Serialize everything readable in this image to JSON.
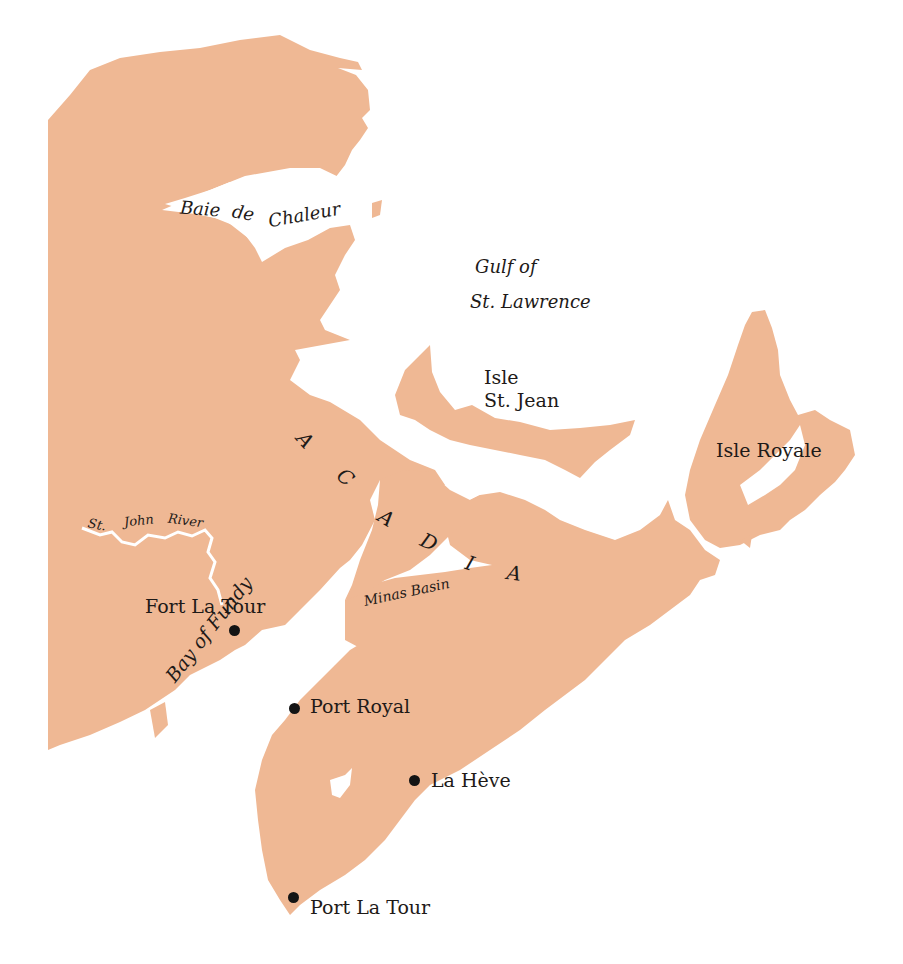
{
  "map": {
    "region": "Acadia",
    "colors": {
      "land": "#efb894",
      "water": "#ffffff",
      "text": "#1e1a18",
      "marker": "#141414"
    },
    "water_labels": [
      {
        "id": "baie-de-chaleur",
        "words": [
          "Baie",
          "de",
          "Chaleur"
        ]
      },
      {
        "id": "gulf",
        "lines": [
          "Gulf of",
          "St. Lawrence"
        ]
      },
      {
        "id": "bay-of-fundy",
        "text": "Bay of Fundy"
      },
      {
        "id": "minas-basin",
        "text": "Minas Basin"
      },
      {
        "id": "st-john-river",
        "words": [
          "St.",
          "John",
          "River"
        ]
      }
    ],
    "island_labels": [
      {
        "id": "isle-st-jean",
        "lines": [
          "Isle",
          "St. Jean"
        ]
      },
      {
        "id": "isle-royale",
        "text": "Isle Royale"
      }
    ],
    "region_label": {
      "letters": [
        "A",
        "C",
        "A",
        "D",
        "I",
        "A"
      ]
    },
    "settlements": [
      {
        "name": "Fort La Tour"
      },
      {
        "name": "Port Royal"
      },
      {
        "name": "La Hève"
      },
      {
        "name": "Port La Tour"
      }
    ]
  }
}
